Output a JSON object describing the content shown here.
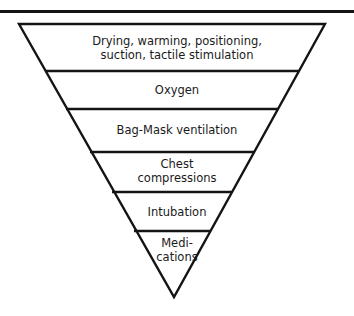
{
  "diagram": {
    "type": "inverted-pyramid",
    "colors": {
      "stroke": "#141414",
      "background": "#ffffff",
      "text": "#1a1a1a"
    },
    "levels": [
      {
        "line1": "Drying, warming, positioning,",
        "line2": "suction, tactile stimulation"
      },
      {
        "line1": "Oxygen",
        "line2": ""
      },
      {
        "line1": "Bag-Mask ventilation",
        "line2": ""
      },
      {
        "line1": "Chest",
        "line2": "compressions"
      },
      {
        "line1": "Intubation",
        "line2": ""
      },
      {
        "line1": "Medi-",
        "line2": "cations"
      }
    ]
  }
}
